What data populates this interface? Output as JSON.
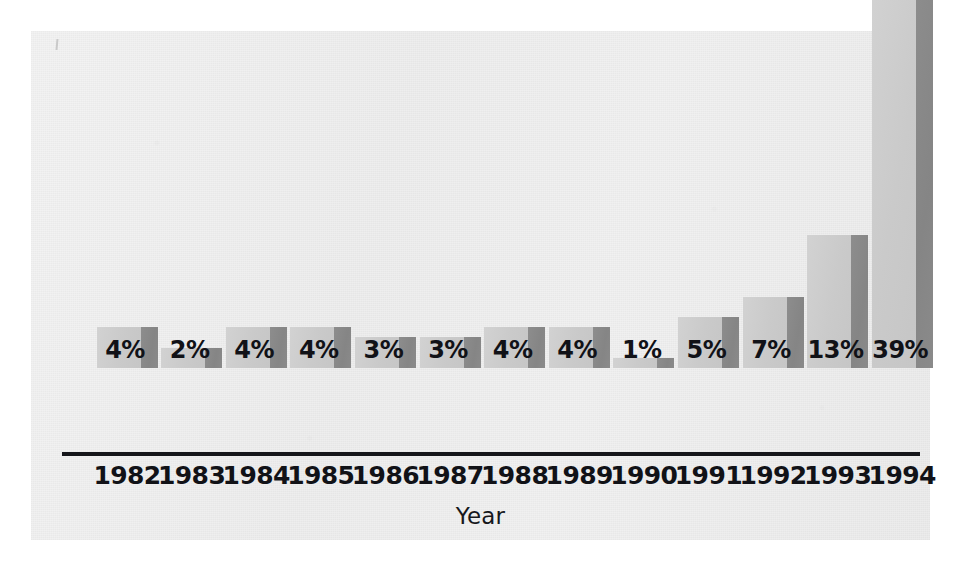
{
  "chart_data": {
    "type": "bar",
    "title": "",
    "subtitle": "",
    "xlabel": "Year",
    "ylabel": "",
    "categories": [
      "1982",
      "1983",
      "1984",
      "1985",
      "1986",
      "1987",
      "1988",
      "1989",
      "1990",
      "1991",
      "1992",
      "1993",
      "1994"
    ],
    "values": [
      4,
      2,
      4,
      4,
      3,
      3,
      4,
      4,
      1,
      5,
      7,
      13,
      39
    ],
    "value_labels": [
      "4%",
      "2%",
      "4%",
      "4%",
      "3%",
      "3%",
      "4%",
      "4%",
      "1%",
      "5%",
      "7%",
      "13%",
      "39%"
    ],
    "unit": "%",
    "ylim": [
      0,
      39
    ],
    "grid": false,
    "legend": null,
    "annotations": []
  },
  "style": {
    "bar_face_color": "#cacaca",
    "bar_side_color": "#888888",
    "axis_color": "#15161a",
    "text_color": "#111217",
    "panel_background": "#f0f0f0",
    "page_background": "#ffffff"
  }
}
